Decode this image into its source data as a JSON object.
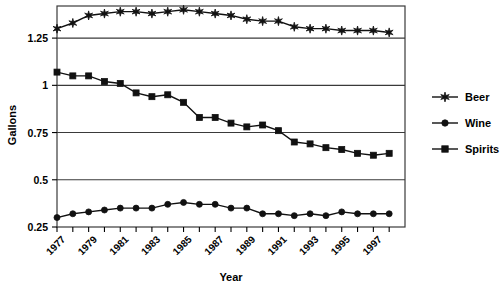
{
  "chart_data": {
    "type": "line",
    "title": "",
    "xlabel": "Year",
    "ylabel": "Gallons",
    "xlim": [
      1977,
      1999
    ],
    "ylim": [
      0.25,
      1.42
    ],
    "grid": true,
    "legend_position": "right",
    "y_ticks": [
      "0.25",
      "0.5",
      "0.75",
      "1",
      "1.25"
    ],
    "y_tick_values": [
      0.25,
      0.5,
      0.75,
      1,
      1.25
    ],
    "x_ticks": [
      "1977",
      "1979",
      "1981",
      "1983",
      "1985",
      "1987",
      "1989",
      "1991",
      "1993",
      "1995",
      "1997"
    ],
    "x_tick_values": [
      1977,
      1979,
      1981,
      1983,
      1985,
      1987,
      1989,
      1991,
      1993,
      1995,
      1997
    ],
    "x": [
      1977,
      1978,
      1979,
      1980,
      1981,
      1982,
      1983,
      1984,
      1985,
      1986,
      1987,
      1988,
      1989,
      1990,
      1991,
      1992,
      1993,
      1994,
      1995,
      1996,
      1997,
      1998
    ],
    "series": [
      {
        "name": "Beer",
        "marker": "star",
        "values": [
          1.3,
          1.33,
          1.37,
          1.38,
          1.39,
          1.39,
          1.38,
          1.39,
          1.4,
          1.39,
          1.38,
          1.37,
          1.35,
          1.34,
          1.34,
          1.31,
          1.3,
          1.3,
          1.29,
          1.29,
          1.29,
          1.28
        ]
      },
      {
        "name": "Wine",
        "marker": "circle",
        "values": [
          0.3,
          0.32,
          0.33,
          0.34,
          0.35,
          0.35,
          0.35,
          0.37,
          0.38,
          0.37,
          0.37,
          0.35,
          0.35,
          0.32,
          0.32,
          0.31,
          0.32,
          0.31,
          0.33,
          0.32,
          0.32,
          0.32
        ]
      },
      {
        "name": "Spirits",
        "marker": "square",
        "values": [
          1.07,
          1.05,
          1.05,
          1.02,
          1.01,
          0.96,
          0.94,
          0.95,
          0.91,
          0.83,
          0.83,
          0.8,
          0.78,
          0.79,
          0.76,
          0.7,
          0.69,
          0.67,
          0.66,
          0.64,
          0.63,
          0.64
        ]
      }
    ],
    "legend": [
      {
        "label": "Beer",
        "marker": "star"
      },
      {
        "label": "Wine",
        "marker": "circle"
      },
      {
        "label": "Spirits",
        "marker": "square"
      }
    ],
    "colors": {
      "line": "#111111",
      "marker": "#111111",
      "grid": "#3a3a3a",
      "frame": "#3a3a3a",
      "background": "#ffffff"
    }
  }
}
